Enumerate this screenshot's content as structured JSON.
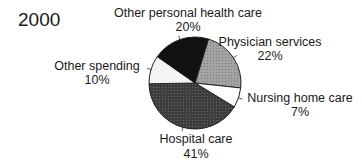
{
  "chart_data": {
    "type": "pie",
    "title": "2000",
    "start_angle_deg": 17,
    "direction": "clockwise",
    "slices": [
      {
        "label": "Physician services",
        "value": 22,
        "value_label": "22%",
        "color": "#9a9a9a"
      },
      {
        "label": "Nursing home care",
        "value": 7,
        "value_label": "7%",
        "color": "#ffffff"
      },
      {
        "label": "Hospital care",
        "value": 41,
        "value_label": "41%",
        "color": "#3a3a3a"
      },
      {
        "label": "Other spending",
        "value": 10,
        "value_label": "10%",
        "color": "#f4f4f4"
      },
      {
        "label": "Other personal health care",
        "value": 20,
        "value_label": "20%",
        "color": "#111111"
      }
    ],
    "legend": "none"
  }
}
